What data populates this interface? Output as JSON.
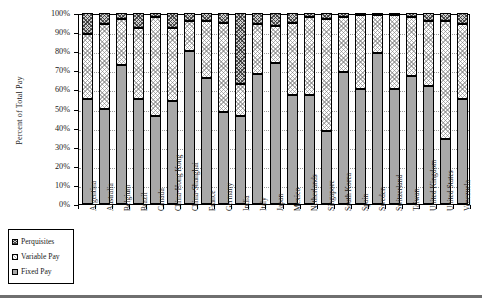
{
  "chart_data": {
    "type": "bar",
    "subtype": "stacked-bar-100-percent",
    "title": "",
    "xlabel": "",
    "ylabel": "Percent of Total Pay",
    "ylim": [
      0,
      100
    ],
    "ytick_labels": [
      "100%",
      "90%",
      "80%",
      "70%",
      "60%",
      "50%",
      "40%",
      "30%",
      "20%",
      "10%",
      "0%"
    ],
    "ytick_values": [
      100,
      90,
      80,
      70,
      60,
      50,
      40,
      30,
      20,
      10,
      0
    ],
    "grid": true,
    "legend_position": "bottom-left",
    "legend_entries": [
      "Perquisites",
      "Variable Pay",
      "Fixed Pay"
    ],
    "stack_order_bottom_to_top": [
      "Fixed Pay",
      "Variable Pay",
      "Perquisites"
    ],
    "categories": [
      "Argentina",
      "Australia",
      "Belgium",
      "Brazil",
      "Canada",
      "China-Hong Kong",
      "China-Shanghai",
      "France",
      "Germany",
      "India",
      "Italy",
      "Japan",
      "Mexico",
      "Netherlands",
      "Singapore",
      "South Korea",
      "Spain",
      "Sweden",
      "Switzerland",
      "Taiwan",
      "United Kingdom",
      "United States",
      "Venezuela"
    ],
    "series": [
      {
        "name": "Fixed Pay",
        "pattern": "solid-gray",
        "color": "#a8a8a8",
        "values": [
          55,
          50,
          73,
          55,
          46,
          54,
          80,
          66,
          48,
          46,
          68,
          74,
          57,
          57,
          38,
          69,
          60,
          79,
          60,
          67,
          62,
          34,
          55
        ]
      },
      {
        "name": "Variable Pay",
        "pattern": "light-stipple",
        "color": "#f0f0f0",
        "values": [
          34,
          44,
          24,
          37,
          52,
          38,
          16,
          30,
          47,
          17,
          26,
          19,
          38,
          41,
          59,
          29,
          39,
          20,
          39,
          31,
          34,
          62,
          39
        ]
      },
      {
        "name": "Perquisites",
        "pattern": "dark-crosshatch",
        "color": "#cfcfcf",
        "values": [
          11,
          6,
          3,
          8,
          2,
          8,
          4,
          4,
          5,
          37,
          6,
          7,
          5,
          2,
          3,
          2,
          1,
          1,
          1,
          2,
          4,
          4,
          6
        ]
      }
    ],
    "cumulative_tops": {
      "fixed": [
        55,
        50,
        73,
        55,
        46,
        54,
        80,
        66,
        48,
        46,
        68,
        74,
        57,
        57,
        38,
        69,
        60,
        79,
        60,
        67,
        62,
        34,
        55
      ],
      "fixed_plus_variable": [
        89,
        94,
        97,
        92,
        98,
        92,
        96,
        96,
        95,
        63,
        94,
        93,
        95,
        98,
        97,
        98,
        99,
        99,
        99,
        98,
        96,
        96,
        94
      ],
      "total": [
        100,
        100,
        100,
        100,
        100,
        100,
        100,
        100,
        100,
        100,
        100,
        100,
        100,
        100,
        100,
        100,
        100,
        100,
        100,
        100,
        100,
        100,
        100
      ]
    }
  },
  "legend": {
    "items": [
      {
        "label": "Perquisites",
        "swatch": "dark-crosshatch"
      },
      {
        "label": "Variable Pay",
        "swatch": "light-stipple"
      },
      {
        "label": "Fixed Pay",
        "swatch": "solid-gray"
      }
    ]
  }
}
